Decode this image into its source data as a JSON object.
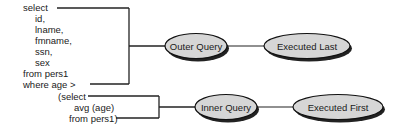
{
  "outer_query": {
    "lines": [
      "select",
      "id,",
      "lname,",
      "fmname,",
      "ssn,",
      "sex",
      "from pers1",
      "where age >"
    ]
  },
  "inner_query": {
    "lines": [
      "(select",
      "avg (age)",
      "from pers1)"
    ]
  },
  "nodes": {
    "outer_query": "Outer Query",
    "executed_last": "Executed Last",
    "inner_query": "Inner Query",
    "executed_first": "Executed First"
  },
  "colors": {
    "ellipse_fill": "#d6d6d6",
    "ellipse_stroke": "#111111",
    "shadow": "#222222",
    "line": "#222222",
    "text": "#1a1a1a"
  }
}
